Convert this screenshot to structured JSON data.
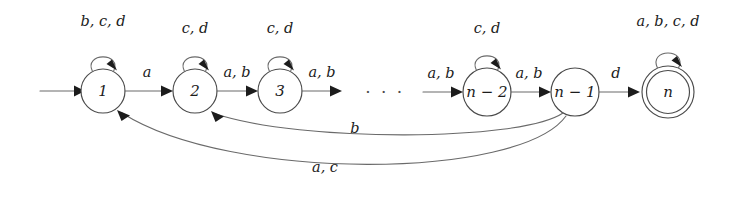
{
  "figure": {
    "background_color": "#ffffff",
    "stroke_color": "#6a6a6a",
    "text_color": "#1c1c1c",
    "width": 743,
    "height": 199
  },
  "alphabet": [
    "a",
    "b",
    "c",
    "d"
  ],
  "start_arrow": {
    "label": "",
    "target": "1"
  },
  "states": [
    {
      "id": "s1",
      "label": "1",
      "cx": 103,
      "cy": 91,
      "r": 22,
      "accepting": false,
      "start": true,
      "self_loop_label": "b, c, d"
    },
    {
      "id": "s2",
      "label": "2",
      "cx": 195,
      "cy": 91,
      "r": 22,
      "accepting": false,
      "start": false,
      "self_loop_label": "c, d"
    },
    {
      "id": "s3",
      "label": "3",
      "cx": 280,
      "cy": 91,
      "r": 22,
      "accepting": false,
      "start": false,
      "self_loop_label": "c, d"
    },
    {
      "id": "sn2",
      "label": "n − 2",
      "cx": 487,
      "cy": 92,
      "r": 24,
      "accepting": false,
      "start": false,
      "self_loop_label": "c, d"
    },
    {
      "id": "sn1",
      "label": "n − 1",
      "cx": 575,
      "cy": 92,
      "r": 24,
      "accepting": false,
      "start": false,
      "self_loop_label": ""
    },
    {
      "id": "sn",
      "label": "n",
      "cx": 668,
      "cy": 92,
      "r": 26,
      "accepting": true,
      "start": false,
      "self_loop_label": "a, b, c, d"
    }
  ],
  "transitions": [
    {
      "id": "t1",
      "from": "s1",
      "to": "s2",
      "label": "a",
      "kind": "straight"
    },
    {
      "id": "t2",
      "from": "s2",
      "to": "s3",
      "label": "a, b",
      "kind": "straight"
    },
    {
      "id": "t3",
      "from": "s3",
      "to": "gap",
      "label": "a, b",
      "kind": "straight"
    },
    {
      "id": "t4",
      "from": "gap",
      "to": "sn2",
      "label": "a, b",
      "kind": "straight"
    },
    {
      "id": "t5",
      "from": "sn2",
      "to": "sn1",
      "label": "a, b",
      "kind": "straight"
    },
    {
      "id": "t6",
      "from": "sn1",
      "to": "sn",
      "label": "d",
      "kind": "straight"
    },
    {
      "id": "t7",
      "from": "sn1",
      "to": "s2",
      "label": "b",
      "kind": "curve-below"
    },
    {
      "id": "t8",
      "from": "sn1",
      "to": "s1",
      "label": "a, c",
      "kind": "curve-below"
    }
  ],
  "ellipsis": {
    "text": "· · ·",
    "x": 385,
    "y": 93
  },
  "self_loop_labels": {
    "s1": "b, c, d",
    "s2": "c, d",
    "s3": "c, d",
    "sn2": "c, d",
    "sn": "a, b, c, d"
  },
  "edge_labels": {
    "s1_s2": "a",
    "s2_s3": "a, b",
    "s3_gap": "a, b",
    "gap_sn2": "a, b",
    "sn2_sn1": "a, b",
    "sn1_sn": "d",
    "return_b": "b",
    "return_ac": "a, c"
  }
}
